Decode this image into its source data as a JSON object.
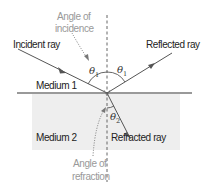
{
  "diagram": {
    "labels": {
      "angle_of_incidence_line1": "Angle of",
      "angle_of_incidence_line2": "incidence",
      "incident_ray": "Incident ray",
      "reflected_ray": "Reflected ray",
      "medium_1": "Medium 1",
      "medium_2": "Medium 2",
      "refracted_ray": "Refracted ray",
      "angle_of_refraction_line1": "Angle of",
      "angle_of_refraction_line2": "refraction"
    },
    "symbols": {
      "theta": "θ",
      "sub_1": "1",
      "sub_2": "2"
    },
    "colors": {
      "medium_2_fill": "#eeeeee",
      "line": "#555555",
      "annotation_text": "#999999",
      "label_text": "#222222"
    }
  }
}
